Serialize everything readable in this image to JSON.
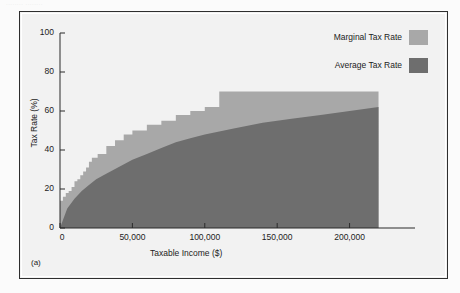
{
  "figure": {
    "panel_letter": "(a)",
    "scan_artifact_text": "........ ........"
  },
  "legend": {
    "position": "top-right",
    "items": [
      {
        "label": "Marginal Tax Rate",
        "color": "#a8a8a8",
        "name": "marginal-tax-rate"
      },
      {
        "label": "Average Tax Rate",
        "color": "#6e6e6e",
        "name": "average-tax-rate"
      }
    ]
  },
  "axes": {
    "xlabel": "Taxable Income ($)",
    "ylabel": "Tax Rate (%)",
    "xticks": [
      "0",
      "50,000",
      "100,000",
      "150,000",
      "200,000"
    ],
    "yticks": [
      "0",
      "20",
      "40",
      "60",
      "80",
      "100"
    ]
  },
  "chart_data": {
    "type": "area",
    "title": "",
    "subtitle": "",
    "xlabel": "Taxable Income ($)",
    "ylabel": "Tax Rate (%)",
    "xlim": [
      0,
      230000
    ],
    "ylim": [
      0,
      100
    ],
    "xticks": [
      0,
      50000,
      100000,
      150000,
      200000
    ],
    "xticklabels": [
      "0",
      "50,000",
      "100,000",
      "150,000",
      "200,000"
    ],
    "yticks": [
      0,
      20,
      40,
      60,
      80,
      100
    ],
    "yticklabels": [
      "0",
      "20",
      "40",
      "60",
      "80",
      "100"
    ],
    "grid": false,
    "legend_position": "upper right",
    "series": [
      {
        "name": "Marginal Tax Rate",
        "color": "#a8a8a8",
        "style": "step",
        "description": "Staircase of statutory bracket rates rising from 0% to a 70% top bracket",
        "brackets": [
          {
            "x_start": 0,
            "x_end": 2000,
            "rate": 14
          },
          {
            "x_start": 2000,
            "x_end": 4000,
            "rate": 16
          },
          {
            "x_start": 4000,
            "x_end": 6000,
            "rate": 18
          },
          {
            "x_start": 6000,
            "x_end": 8000,
            "rate": 19
          },
          {
            "x_start": 8000,
            "x_end": 10000,
            "rate": 21
          },
          {
            "x_start": 10000,
            "x_end": 12000,
            "rate": 24
          },
          {
            "x_start": 12000,
            "x_end": 14000,
            "rate": 25
          },
          {
            "x_start": 14000,
            "x_end": 16000,
            "rate": 27
          },
          {
            "x_start": 16000,
            "x_end": 18000,
            "rate": 29
          },
          {
            "x_start": 18000,
            "x_end": 20000,
            "rate": 31
          },
          {
            "x_start": 20000,
            "x_end": 22000,
            "rate": 34
          },
          {
            "x_start": 22000,
            "x_end": 26000,
            "rate": 36
          },
          {
            "x_start": 26000,
            "x_end": 32000,
            "rate": 38
          },
          {
            "x_start": 32000,
            "x_end": 38000,
            "rate": 42
          },
          {
            "x_start": 38000,
            "x_end": 44000,
            "rate": 45
          },
          {
            "x_start": 44000,
            "x_end": 50000,
            "rate": 48
          },
          {
            "x_start": 50000,
            "x_end": 60000,
            "rate": 50
          },
          {
            "x_start": 60000,
            "x_end": 70000,
            "rate": 53
          },
          {
            "x_start": 70000,
            "x_end": 80000,
            "rate": 55
          },
          {
            "x_start": 80000,
            "x_end": 90000,
            "rate": 58
          },
          {
            "x_start": 90000,
            "x_end": 100000,
            "rate": 60
          },
          {
            "x_start": 100000,
            "x_end": 110000,
            "rate": 62
          },
          {
            "x_start": 110000,
            "x_end": 220000,
            "rate": 70
          }
        ],
        "x": [
          0,
          2000,
          4000,
          6000,
          8000,
          10000,
          12000,
          14000,
          16000,
          18000,
          20000,
          22000,
          26000,
          32000,
          38000,
          44000,
          50000,
          60000,
          70000,
          80000,
          90000,
          100000,
          110000,
          220000
        ],
        "y": [
          14,
          16,
          18,
          19,
          21,
          24,
          25,
          27,
          29,
          31,
          34,
          36,
          38,
          42,
          45,
          48,
          50,
          53,
          55,
          58,
          60,
          62,
          70,
          70
        ]
      },
      {
        "name": "Average Tax Rate",
        "color": "#6e6e6e",
        "style": "smooth",
        "description": "Concave effective-rate curve rising from 0% toward about 62% at the top of the range",
        "x": [
          0,
          5000,
          10000,
          15000,
          20000,
          25000,
          30000,
          40000,
          50000,
          60000,
          70000,
          80000,
          90000,
          100000,
          120000,
          140000,
          160000,
          180000,
          200000,
          220000
        ],
        "y": [
          0,
          10,
          15,
          19,
          22,
          25,
          27,
          31,
          35,
          38,
          41,
          44,
          46,
          48,
          51,
          54,
          56,
          58,
          60,
          62
        ]
      }
    ]
  }
}
